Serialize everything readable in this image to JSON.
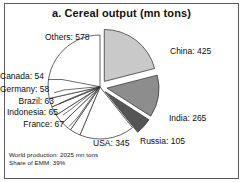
{
  "panel": {
    "title": "a. Cereal output (mn tons)",
    "border_color": "#5a5a5a",
    "background": "#ffffff"
  },
  "footer": {
    "world_production": "World production: 2025 mn tons",
    "share_of_emm": "Share of EMM: 39%"
  },
  "labels": {
    "others": "Others: 578",
    "china": "China: 425",
    "india": "India: 265",
    "russia": "Russia: 105",
    "usa": "USA: 345",
    "france": "France: 67",
    "indonesia": "Indonesia: 65",
    "brazil": "Brazil: 63",
    "germany": "Germany: 58",
    "canada": "Canada: 54"
  },
  "chart_data": {
    "type": "pie",
    "title": "a. Cereal output (mn tons)",
    "unit": "mn tons",
    "total": 2025,
    "legend_position": "callout-labels",
    "grid": false,
    "start_angle_deg": 0,
    "direction": "clockwise",
    "categories": [
      "China",
      "India",
      "Russia",
      "USA",
      "France",
      "Indonesia",
      "Brazil",
      "Germany",
      "Canada",
      "Others"
    ],
    "values": [
      425,
      265,
      105,
      345,
      67,
      65,
      63,
      58,
      54,
      578
    ],
    "value_labels": [
      "China: 425",
      "India: 265",
      "Russia: 105",
      "USA: 345",
      "France: 67",
      "Indonesia: 65",
      "Brazil: 63",
      "Germany: 58",
      "Canada: 54",
      "Others: 578"
    ],
    "slices": [
      {
        "name": "China",
        "value": 425,
        "percent": 21.0,
        "color": "#c9c9c9",
        "exploded": true
      },
      {
        "name": "India",
        "value": 265,
        "percent": 13.1,
        "color": "#8d8d8d",
        "exploded": true
      },
      {
        "name": "Russia",
        "value": 105,
        "percent": 5.2,
        "color": "#555555",
        "exploded": true
      },
      {
        "name": "USA",
        "value": 345,
        "percent": 17.0,
        "color": "#ffffff",
        "exploded": false
      },
      {
        "name": "France",
        "value": 67,
        "percent": 3.3,
        "color": "#ffffff",
        "exploded": false
      },
      {
        "name": "Indonesia",
        "value": 65,
        "percent": 3.2,
        "color": "#ffffff",
        "exploded": false
      },
      {
        "name": "Brazil",
        "value": 63,
        "percent": 3.1,
        "color": "#ffffff",
        "exploded": false
      },
      {
        "name": "Germany",
        "value": 58,
        "percent": 2.9,
        "color": "#ffffff",
        "exploded": false
      },
      {
        "name": "Canada",
        "value": 54,
        "percent": 2.7,
        "color": "#ffffff",
        "exploded": false
      },
      {
        "name": "Others",
        "value": 578,
        "percent": 28.5,
        "color": "#ffffff",
        "exploded": false
      }
    ],
    "annotations": [
      "World production: 2025 mn tons",
      "Share of EMM: 39%"
    ],
    "xlabel": "",
    "ylabel": ""
  }
}
